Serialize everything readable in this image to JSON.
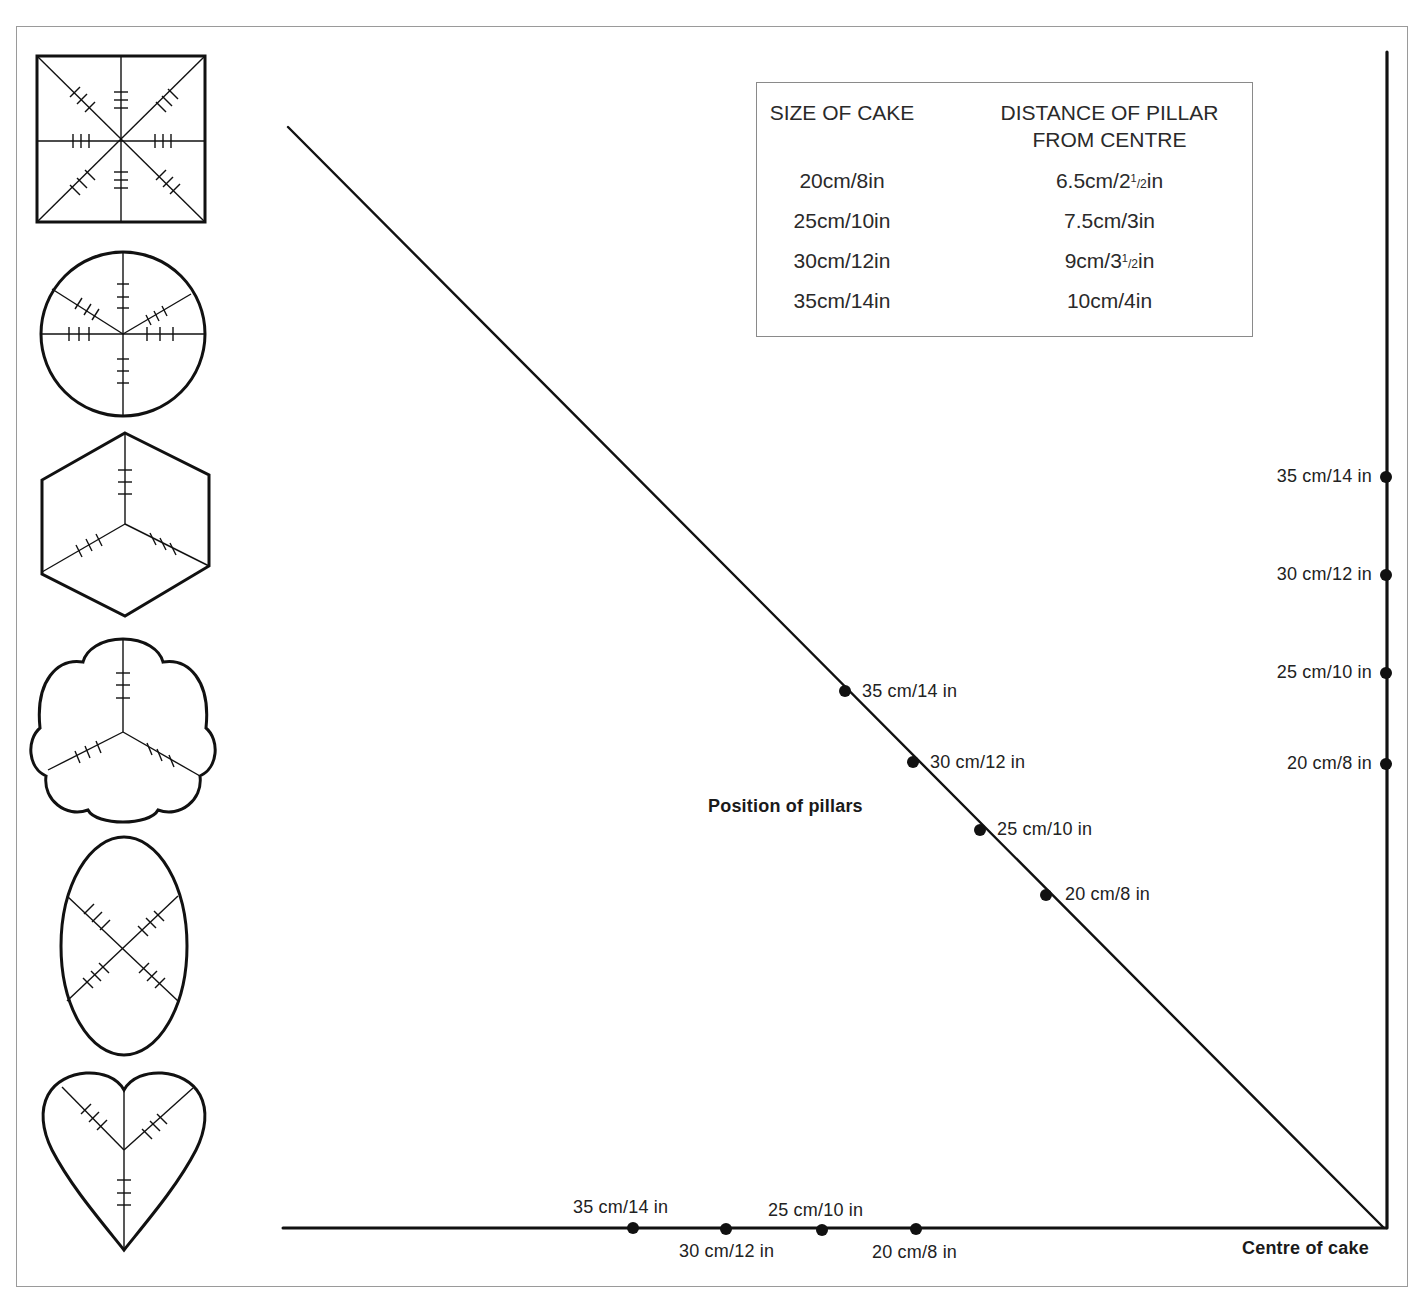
{
  "table": {
    "headers": [
      "SIZE OF CAKE",
      "DISTANCE OF PILLAR FROM CENTRE"
    ],
    "header_line2": "FROM CENTRE",
    "header_line1": "DISTANCE OF PILLAR",
    "rows": [
      {
        "size": "20cm/8in",
        "distance": "6.5cm/2½in",
        "dist_main": "6.5cm/2",
        "dist_tail": "in"
      },
      {
        "size": "25cm/10in",
        "distance": "7.5cm/3in",
        "dist_main": "7.5cm/3in",
        "dist_tail": ""
      },
      {
        "size": "30cm/12in",
        "distance": "9cm/3½in",
        "dist_main": "9cm/3",
        "dist_tail": "in"
      },
      {
        "size": "35cm/14in",
        "distance": "10cm/4in",
        "dist_main": "10cm/4in",
        "dist_tail": ""
      }
    ],
    "frac_num": "1",
    "frac_den": "/2"
  },
  "shapes": [
    {
      "name": "square",
      "arms": 8
    },
    {
      "name": "round",
      "arms": 6
    },
    {
      "name": "hexagonal",
      "arms": 3
    },
    {
      "name": "petal",
      "arms": 3
    },
    {
      "name": "oval",
      "arms": 4
    },
    {
      "name": "heart",
      "arms": 3
    }
  ],
  "labels": {
    "diagonal_title": "Position of pillars",
    "centre": "Centre of cake"
  },
  "diagonal_points": [
    {
      "label": "35 cm/14 in",
      "x": 845,
      "y": 691
    },
    {
      "label": "30 cm/12 in",
      "x": 913,
      "y": 762
    },
    {
      "label": "25 cm/10 in",
      "x": 980,
      "y": 830
    },
    {
      "label": "20 cm/8 in",
      "x": 1046,
      "y": 895
    }
  ],
  "vertical_points": [
    {
      "label": "35 cm/14 in",
      "y": 477
    },
    {
      "label": "30 cm/12 in",
      "y": 575
    },
    {
      "label": "25 cm/10 in",
      "y": 673
    },
    {
      "label": "20 cm/8 in",
      "y": 764
    }
  ],
  "horizontal_points": [
    {
      "label": "35 cm/14 in",
      "x": 633,
      "pos": "above"
    },
    {
      "label": "30 cm/12 in",
      "x": 726,
      "pos": "below"
    },
    {
      "label": "25 cm/10 in",
      "x": 822,
      "pos": "above"
    },
    {
      "label": "20 cm/8 in",
      "x": 916,
      "pos": "below"
    }
  ],
  "colors": {
    "ink": "#111111",
    "frame": "#9a9a9a",
    "background": "#ffffff"
  }
}
